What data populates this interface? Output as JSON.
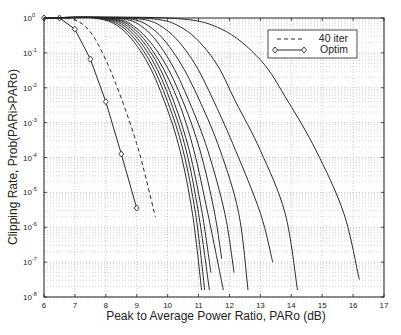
{
  "chart_data": {
    "type": "line",
    "title": "",
    "xlabel": "Peak to Average Power Ratio, PARo (dB)",
    "ylabel": "Clipping Rate, Prob(PARi>PARo)",
    "xlim": [
      6,
      17
    ],
    "ylim": [
      1e-08,
      1
    ],
    "yscale": "log",
    "xticks": [
      6,
      7,
      8,
      9,
      10,
      11,
      12,
      13,
      14,
      15,
      16,
      17
    ],
    "yticks": [
      "10^0",
      "10^-1",
      "10^-2",
      "10^-3",
      "10^-4",
      "10^-5",
      "10^-6",
      "10^-7",
      "10^-8"
    ],
    "grid": true,
    "legend_position": "upper right",
    "legend": [
      {
        "label": "40 iter",
        "style": "dashed"
      },
      {
        "label": "Optim",
        "style": "solid-diamond"
      }
    ],
    "series": [
      {
        "name": "Optim",
        "style": "solid-diamond",
        "x": [
          6.0,
          6.5,
          7.0,
          7.5,
          8.0,
          8.5,
          9.0
        ],
        "log10_y": [
          0,
          0,
          -0.32,
          -1.18,
          -2.4,
          -3.9,
          -5.45
        ]
      },
      {
        "name": "40 iter",
        "style": "dashed",
        "x": [
          6.5,
          7.0,
          7.5,
          8.0,
          8.5,
          9.0,
          9.3,
          9.6
        ],
        "log10_y": [
          0,
          -0.05,
          -0.4,
          -1.2,
          -2.3,
          -3.6,
          -4.6,
          -5.7
        ]
      },
      {
        "name": "iter 1",
        "style": "solid",
        "x": [
          7.6,
          8.5,
          9.3,
          9.9,
          10.4,
          10.8,
          11.1
        ],
        "log10_y": [
          0,
          -0.3,
          -1.2,
          -2.4,
          -3.8,
          -5.6,
          -7.8
        ]
      },
      {
        "name": "iter 2",
        "style": "solid",
        "x": [
          7.7,
          8.6,
          9.4,
          10.0,
          10.5,
          10.9,
          11.2
        ],
        "log10_y": [
          0,
          -0.3,
          -1.2,
          -2.4,
          -3.8,
          -5.6,
          -7.8
        ]
      },
      {
        "name": "iter 3",
        "style": "solid",
        "x": [
          7.8,
          8.7,
          9.5,
          10.1,
          10.6,
          11.0,
          11.35
        ],
        "log10_y": [
          0,
          -0.3,
          -1.2,
          -2.4,
          -3.8,
          -5.6,
          -7.8
        ]
      },
      {
        "name": "iter 4",
        "style": "solid",
        "x": [
          7.9,
          8.8,
          9.6,
          10.2,
          10.7,
          11.1,
          11.4
        ],
        "log10_y": [
          0,
          -0.3,
          -1.2,
          -2.4,
          -3.8,
          -5.5,
          -7.3
        ]
      },
      {
        "name": "iter 5",
        "style": "solid",
        "x": [
          8.0,
          8.9,
          9.7,
          10.35,
          10.85,
          11.3,
          11.8
        ],
        "log10_y": [
          0,
          -0.3,
          -1.2,
          -2.4,
          -3.8,
          -5.6,
          -7.8
        ]
      },
      {
        "name": "iter 6",
        "style": "solid",
        "x": [
          8.1,
          9.0,
          9.85,
          10.5,
          11.05,
          11.5,
          11.75
        ],
        "log10_y": [
          0,
          -0.3,
          -1.2,
          -2.4,
          -3.8,
          -5.5,
          -6.9
        ]
      },
      {
        "name": "iter 7",
        "style": "solid",
        "x": [
          8.3,
          9.25,
          10.05,
          10.7,
          11.3,
          11.85,
          12.15
        ],
        "log10_y": [
          0,
          -0.3,
          -1.2,
          -2.4,
          -3.8,
          -5.6,
          -7.3
        ]
      },
      {
        "name": "iter 8",
        "style": "solid",
        "x": [
          8.5,
          9.5,
          10.35,
          11.05,
          11.7,
          12.3,
          12.6
        ],
        "log10_y": [
          0,
          -0.3,
          -1.2,
          -2.4,
          -3.8,
          -5.6,
          -7.8
        ]
      },
      {
        "name": "iter 9",
        "style": "solid",
        "x": [
          8.8,
          9.9,
          10.8,
          11.5,
          12.2,
          13.0,
          13.4
        ],
        "log10_y": [
          0,
          -0.3,
          -1.2,
          -2.4,
          -3.8,
          -5.6,
          -7.0
        ]
      },
      {
        "name": "iter 10",
        "style": "solid",
        "x": [
          9.2,
          10.5,
          11.5,
          12.2,
          13.0,
          13.8,
          14.2
        ],
        "log10_y": [
          0,
          -0.3,
          -1.2,
          -2.4,
          -3.8,
          -5.6,
          -7.8
        ]
      },
      {
        "name": "iter 11",
        "style": "solid",
        "x": [
          10.0,
          11.7,
          13.0,
          13.9,
          14.8,
          15.7,
          16.2
        ],
        "log10_y": [
          0,
          -0.3,
          -1.2,
          -2.4,
          -3.8,
          -5.6,
          -7.5
        ]
      }
    ]
  },
  "axes": {
    "xlabel": "Peak to Average Power Ratio, PARo (dB)",
    "ylabel": "Clipping Rate, Prob(PARi>PARo)",
    "xtick_labels": [
      "6",
      "7",
      "8",
      "9",
      "10",
      "11",
      "12",
      "13",
      "14",
      "15",
      "16",
      "17"
    ],
    "ytick_exponents": [
      "0",
      "-1",
      "-2",
      "-3",
      "-4",
      "-5",
      "-6",
      "-7",
      "-8"
    ]
  },
  "legend": {
    "items": [
      {
        "label": "40 iter"
      },
      {
        "label": "Optim"
      }
    ]
  },
  "colors": {
    "line": "#2a2a2a",
    "grid": "#9a9a9a",
    "axis": "#222222",
    "background": "#ffffff"
  }
}
